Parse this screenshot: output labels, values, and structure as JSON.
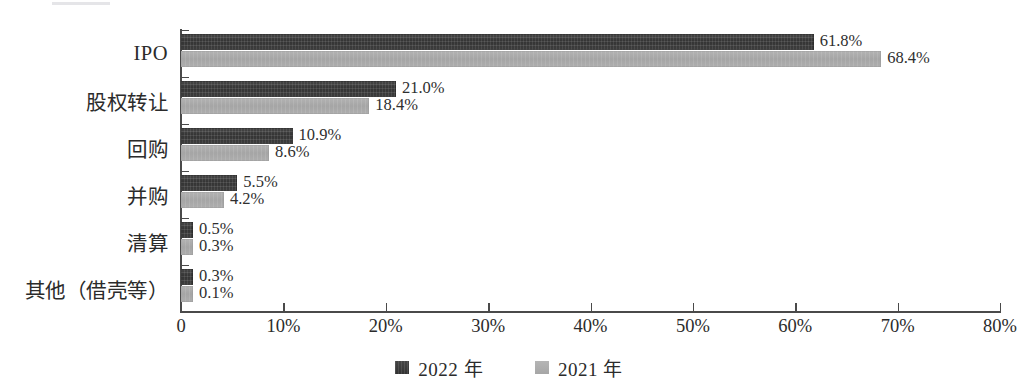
{
  "chart_data": {
    "type": "bar",
    "orientation": "horizontal",
    "title": "",
    "subtitle": "",
    "xlabel": "",
    "ylabel": "",
    "xlim": [
      0,
      80
    ],
    "xtick_labels": [
      "0",
      "10%",
      "20%",
      "30%",
      "40%",
      "50%",
      "60%",
      "70%",
      "80%"
    ],
    "xtick_values": [
      0,
      10,
      20,
      30,
      40,
      50,
      60,
      70,
      80
    ],
    "grid": false,
    "legend_position": "bottom-center",
    "categories": [
      "IPO",
      "股权转让",
      "回购",
      "并购",
      "清算",
      "其他（借壳等）"
    ],
    "series": [
      {
        "name": "2022 年",
        "color": "#383838",
        "values": [
          61.8,
          21.0,
          10.9,
          5.5,
          0.5,
          0.3
        ],
        "labels": [
          "61.8%",
          "21.0%",
          "10.9%",
          "5.5%",
          "0.5%",
          "0.3%"
        ]
      },
      {
        "name": "2021 年",
        "color": "#a8a8a8",
        "values": [
          68.4,
          18.4,
          8.6,
          4.2,
          0.3,
          0.1
        ],
        "labels": [
          "68.4%",
          "18.4%",
          "8.6%",
          "4.2%",
          "0.3%",
          "0.1%"
        ]
      }
    ]
  },
  "legend": {
    "items": [
      {
        "label": "2022 年",
        "swatch": "dark-square-swatch"
      },
      {
        "label": "2021 年",
        "swatch": "gray-square-swatch"
      }
    ]
  },
  "caption": {
    "clipped_text": ""
  }
}
